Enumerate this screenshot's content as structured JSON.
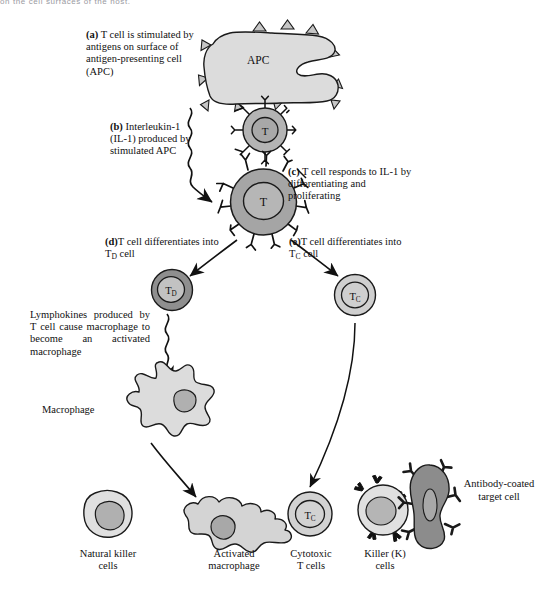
{
  "page": {
    "running_head": "on the cell surfaces of the host."
  },
  "figure": {
    "steps": [
      {
        "id": "a",
        "marker": "(a)",
        "text": "T cell is stimulated by antigens on surface of antigen-presenting cell (APC)"
      },
      {
        "id": "b",
        "marker": "(b)",
        "text": "Interleukin-1 (IL-1) produced by stimulated APC"
      },
      {
        "id": "c",
        "marker": "(c)",
        "text": "T cell responds to IL-1 by differentiating and proliferating"
      },
      {
        "id": "d",
        "marker": "(d)",
        "text": "T cell differentiates into T",
        "sub": "D",
        "tail": " cell"
      },
      {
        "id": "e",
        "marker": "(e)",
        "text": "T cell differentiates into T",
        "sub": "C",
        "tail": " cell"
      }
    ],
    "lymphokine_note": "Lymphokines produced by T cell cause macrophage to become an  activated macrophage",
    "cells": {
      "apc_label": "APC",
      "t_label": "T",
      "td_label": "T",
      "td_sub": "D",
      "tc_label": "T",
      "tc_sub": "C",
      "macrophage_label": "Macrophage",
      "antibody_target_label": "Antibody-coated target cell"
    },
    "outcomes": [
      {
        "line1": "Natural killer",
        "line2": "cells"
      },
      {
        "line1": "Activated",
        "line2": "macrophage"
      },
      {
        "line1": "Cytotoxic",
        "line2": "T cells"
      },
      {
        "line1": "Killer (K)",
        "line2": "cells"
      }
    ],
    "colors": {
      "outline": "#1a1a1a",
      "cell_light": "#d9d9d9",
      "cell_mid": "#b4b4b4",
      "cell_dark": "#9a9a9a",
      "nucleus": "#a8a8a8",
      "apc_fill": "#dcdcdc",
      "target_fill": "#8f8f8f",
      "background": "#ffffff"
    }
  }
}
